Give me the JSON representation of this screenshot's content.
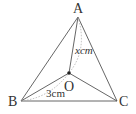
{
  "diagram": {
    "type": "geometry-triangle",
    "vertices": {
      "A": {
        "label": "A",
        "x": 78,
        "y": 17
      },
      "B": {
        "label": "B",
        "x": 21,
        "y": 101
      },
      "C": {
        "label": "C",
        "x": 117,
        "y": 101
      }
    },
    "center": {
      "label": "O",
      "x": 69,
      "y": 73
    },
    "measurements": {
      "OA": "xcm",
      "OB": "3cm"
    },
    "colors": {
      "line": "#555555",
      "dotted": "#aaaaaa",
      "text": "#333333"
    }
  }
}
